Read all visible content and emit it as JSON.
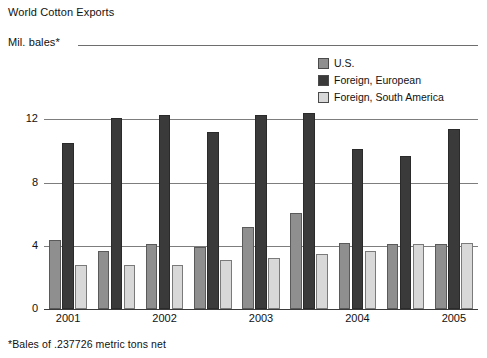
{
  "chart": {
    "title": "World Cotton Exports",
    "unit_label": "Mil. bales*",
    "footnote": "*Bales of .237726 metric tons net"
  },
  "legend": {
    "position": "top-right",
    "items": [
      {
        "label": "U.S.",
        "swatch": "medium-gray-swatch",
        "color": "#8f8f8f"
      },
      {
        "label": "Foreign, European",
        "swatch": "dark-gray-swatch",
        "color": "#3a3a3a"
      },
      {
        "label": "Foreign, South America",
        "swatch": "light-gray-swatch",
        "color": "#d8d8d8"
      }
    ]
  },
  "axes": {
    "y_ticks": [
      "0",
      "4",
      "8",
      "12"
    ],
    "y_values": [
      0,
      4,
      8,
      12
    ],
    "ylim": [
      0,
      12.6
    ],
    "x_tick_labels": [
      "2001",
      "2002",
      "2003",
      "2004",
      "2005"
    ],
    "x_tick_group_index": [
      0,
      2,
      4,
      6,
      8
    ],
    "grid": "horizontal"
  },
  "chart_data": {
    "type": "bar",
    "title": "World Cotton Exports",
    "xlabel": "",
    "ylabel": "Mil. bales*",
    "ylim": [
      0,
      12.6
    ],
    "yticks": [
      0,
      4,
      8,
      12
    ],
    "grid": true,
    "legend_position": "top-right",
    "annotations": [
      "*Bales of .237726 metric tons net"
    ],
    "categories": [
      "2001",
      "",
      "2002",
      "",
      "2003",
      "",
      "2004",
      "",
      "2005"
    ],
    "series": [
      {
        "name": "U.S.",
        "color": "#8f8f8f",
        "values": [
          4.4,
          3.7,
          4.1,
          3.9,
          5.2,
          6.1,
          4.2,
          4.1,
          4.1
        ]
      },
      {
        "name": "Foreign, European",
        "color": "#3a3a3a",
        "values": [
          10.5,
          12.1,
          12.3,
          11.2,
          12.3,
          12.4,
          10.1,
          9.7,
          11.4
        ]
      },
      {
        "name": "Foreign, South America",
        "color": "#d8d8d8",
        "values": [
          2.8,
          2.8,
          2.8,
          3.1,
          3.2,
          3.5,
          3.7,
          4.1,
          4.2
        ]
      }
    ]
  }
}
